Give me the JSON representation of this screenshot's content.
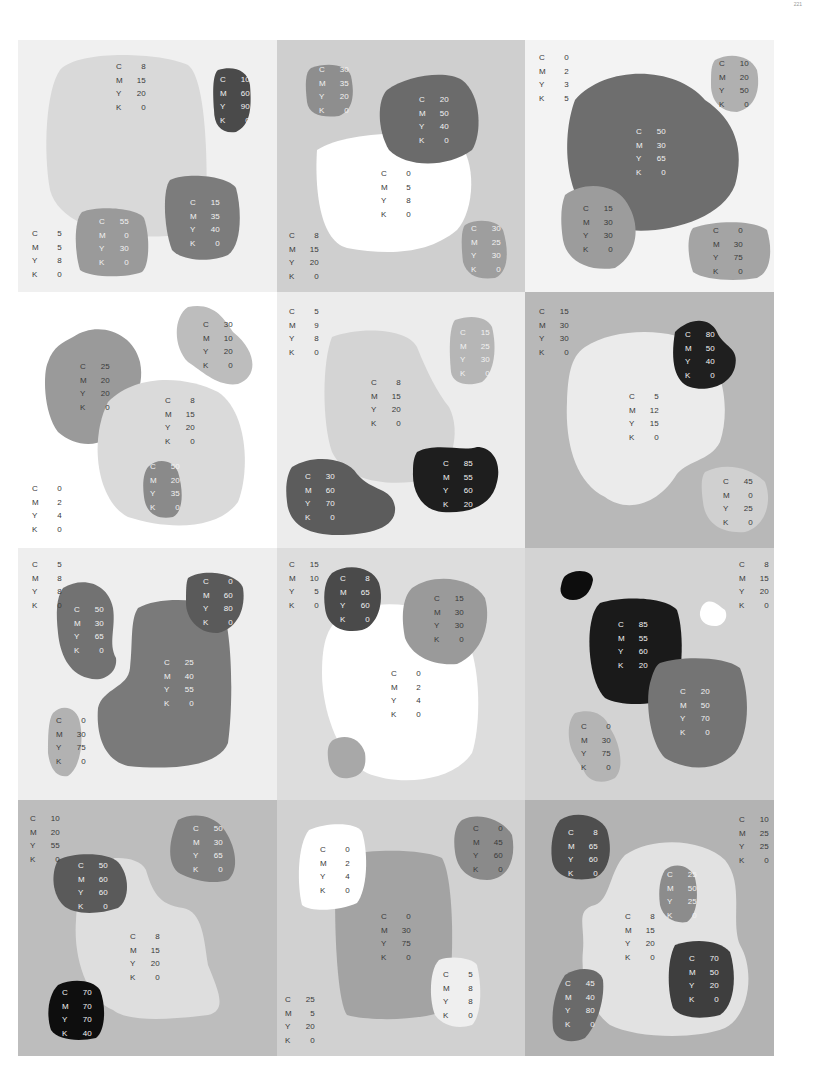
{
  "page_number": "221",
  "channel_letters": [
    "C",
    "M",
    "Y",
    "K"
  ],
  "panels": [
    {
      "id": "r1c1",
      "background": "#f0f0f0",
      "swatches": [
        {
          "role": "background",
          "cmyk": [
            5,
            5,
            8,
            0
          ]
        },
        {
          "role": "large-shape",
          "cmyk": [
            8,
            15,
            20,
            0
          ]
        },
        {
          "role": "small-shape",
          "cmyk": [
            10,
            60,
            90,
            0
          ]
        },
        {
          "role": "small-shape",
          "cmyk": [
            55,
            0,
            30,
            0
          ]
        },
        {
          "role": "small-shape",
          "cmyk": [
            15,
            35,
            40,
            0
          ]
        }
      ]
    },
    {
      "id": "r1c2",
      "background": "#cfcfcf",
      "swatches": [
        {
          "role": "background",
          "cmyk": [
            8,
            15,
            20,
            0
          ]
        },
        {
          "role": "large-shape",
          "cmyk": [
            0,
            5,
            8,
            0
          ]
        },
        {
          "role": "small-shape",
          "cmyk": [
            30,
            35,
            20,
            0
          ]
        },
        {
          "role": "small-shape",
          "cmyk": [
            20,
            50,
            40,
            0
          ]
        },
        {
          "role": "small-shape",
          "cmyk": [
            30,
            25,
            30,
            0
          ]
        }
      ]
    },
    {
      "id": "r1c3",
      "background": "#f3f3f3",
      "swatches": [
        {
          "role": "background",
          "cmyk": [
            0,
            2,
            3,
            5
          ]
        },
        {
          "role": "large-shape",
          "cmyk": [
            50,
            30,
            65,
            0
          ]
        },
        {
          "role": "small-shape",
          "cmyk": [
            10,
            20,
            50,
            0
          ]
        },
        {
          "role": "small-shape",
          "cmyk": [
            15,
            30,
            30,
            0
          ]
        },
        {
          "role": "small-shape",
          "cmyk": [
            0,
            30,
            75,
            0
          ]
        }
      ]
    },
    {
      "id": "r2c1",
      "background": "#ffffff",
      "swatches": [
        {
          "role": "background",
          "cmyk": [
            0,
            2,
            4,
            0
          ]
        },
        {
          "role": "large-shape",
          "cmyk": [
            8,
            15,
            20,
            0
          ]
        },
        {
          "role": "small-shape",
          "cmyk": [
            25,
            20,
            20,
            0
          ]
        },
        {
          "role": "small-shape",
          "cmyk": [
            30,
            10,
            20,
            0
          ]
        },
        {
          "role": "small-shape",
          "cmyk": [
            50,
            20,
            35,
            0
          ]
        }
      ]
    },
    {
      "id": "r2c2",
      "background": "#ececec",
      "swatches": [
        {
          "role": "background",
          "cmyk": [
            5,
            9,
            8,
            0
          ]
        },
        {
          "role": "large-shape",
          "cmyk": [
            8,
            15,
            20,
            0
          ]
        },
        {
          "role": "small-shape",
          "cmyk": [
            15,
            25,
            30,
            0
          ]
        },
        {
          "role": "small-shape",
          "cmyk": [
            30,
            60,
            70,
            0
          ]
        },
        {
          "role": "small-shape",
          "cmyk": [
            85,
            55,
            60,
            20
          ]
        }
      ]
    },
    {
      "id": "r2c3",
      "background": "#b8b8b8",
      "swatches": [
        {
          "role": "background",
          "cmyk": [
            15,
            30,
            30,
            0
          ]
        },
        {
          "role": "large-shape",
          "cmyk": [
            5,
            12,
            15,
            0
          ]
        },
        {
          "role": "small-shape",
          "cmyk": [
            80,
            50,
            40,
            0
          ]
        },
        {
          "role": "small-shape",
          "cmyk": [
            45,
            0,
            25,
            0
          ]
        }
      ]
    },
    {
      "id": "r3c1",
      "background": "#eeeeee",
      "swatches": [
        {
          "role": "background",
          "cmyk": [
            5,
            8,
            8,
            0
          ]
        },
        {
          "role": "large-shape",
          "cmyk": [
            25,
            40,
            55,
            0
          ]
        },
        {
          "role": "small-shape",
          "cmyk": [
            50,
            30,
            65,
            0
          ]
        },
        {
          "role": "small-shape",
          "cmyk": [
            0,
            60,
            80,
            0
          ]
        },
        {
          "role": "small-shape",
          "cmyk": [
            0,
            30,
            75,
            0
          ]
        }
      ]
    },
    {
      "id": "r3c2",
      "background": "#dddddd",
      "swatches": [
        {
          "role": "background",
          "cmyk": [
            15,
            10,
            5,
            0
          ]
        },
        {
          "role": "large-shape",
          "cmyk": [
            0,
            2,
            4,
            0
          ]
        },
        {
          "role": "small-shape",
          "cmyk": [
            8,
            65,
            60,
            0
          ]
        },
        {
          "role": "small-shape",
          "cmyk": [
            15,
            30,
            30,
            0
          ]
        }
      ]
    },
    {
      "id": "r3c3",
      "background": "#d3d3d3",
      "swatches": [
        {
          "role": "background",
          "cmyk": [
            8,
            15,
            20,
            0
          ]
        },
        {
          "role": "large-shape",
          "cmyk": [
            85,
            55,
            60,
            20
          ]
        },
        {
          "role": "small-shape",
          "cmyk": [
            20,
            50,
            70,
            0
          ]
        },
        {
          "role": "small-shape",
          "cmyk": [
            0,
            30,
            75,
            0
          ]
        }
      ]
    },
    {
      "id": "r4c1",
      "background": "#bdbdbd",
      "swatches": [
        {
          "role": "background",
          "cmyk": [
            10,
            20,
            55,
            0
          ]
        },
        {
          "role": "large-shape",
          "cmyk": [
            8,
            15,
            20,
            0
          ]
        },
        {
          "role": "small-shape",
          "cmyk": [
            50,
            60,
            60,
            0
          ]
        },
        {
          "role": "small-shape",
          "cmyk": [
            50,
            30,
            65,
            0
          ]
        },
        {
          "role": "small-shape",
          "cmyk": [
            70,
            70,
            70,
            40
          ]
        }
      ]
    },
    {
      "id": "r4c2",
      "background": "#d1d1d1",
      "swatches": [
        {
          "role": "background",
          "cmyk": [
            25,
            5,
            20,
            0
          ]
        },
        {
          "role": "large-shape",
          "cmyk": [
            0,
            30,
            75,
            0
          ]
        },
        {
          "role": "small-shape",
          "cmyk": [
            0,
            2,
            4,
            0
          ]
        },
        {
          "role": "small-shape",
          "cmyk": [
            0,
            45,
            60,
            0
          ]
        },
        {
          "role": "small-shape",
          "cmyk": [
            5,
            8,
            8,
            0
          ]
        }
      ]
    },
    {
      "id": "r4c3",
      "background": "#b3b3b3",
      "swatches": [
        {
          "role": "background",
          "cmyk": [
            10,
            25,
            25,
            0
          ]
        },
        {
          "role": "large-shape",
          "cmyk": [
            8,
            15,
            20,
            0
          ]
        },
        {
          "role": "small-shape",
          "cmyk": [
            8,
            65,
            60,
            0
          ]
        },
        {
          "role": "small-shape",
          "cmyk": [
            25,
            50,
            25,
            0
          ]
        },
        {
          "role": "small-shape",
          "cmyk": [
            70,
            50,
            20,
            0
          ]
        },
        {
          "role": "small-shape",
          "cmyk": [
            45,
            40,
            80,
            0
          ]
        }
      ]
    }
  ]
}
